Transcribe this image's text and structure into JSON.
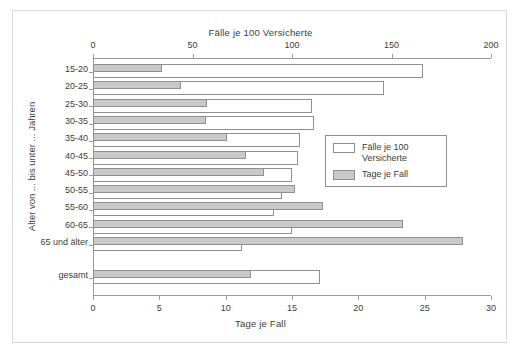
{
  "chart_data": {
    "type": "bar",
    "orientation": "horizontal",
    "title": "",
    "top_axis_title": "Fälle je 100 Versicherte",
    "bottom_axis_title": "Tage je Fall",
    "ylabel": "Alter von ... bis unter ... Jahren",
    "categories": [
      "15-20",
      "20-25",
      "25-30",
      "30-35",
      "35-40",
      "40-45",
      "45-50",
      "50-55",
      "55-60",
      "60-65",
      "65 und älter",
      "gesamt"
    ],
    "top_axis": {
      "label": "Fälle je 100 Versicherte",
      "ticks": [
        0,
        50,
        100,
        150,
        200
      ],
      "min": 0,
      "max": 200
    },
    "bottom_axis": {
      "label": "Tage je Fall",
      "ticks": [
        0,
        5,
        10,
        15,
        20,
        25,
        30
      ],
      "min": 0,
      "max": 30
    },
    "grid": false,
    "legend_position": "center-right",
    "series": [
      {
        "name": "Fälle je 100 Versicherte",
        "axis": "top",
        "color": "#ffffff",
        "edge": "#8f8f8f",
        "values": [
          166,
          146,
          110,
          111,
          104,
          103,
          100,
          95,
          91,
          100,
          75,
          114
        ]
      },
      {
        "name": "Tage je Fall",
        "axis": "bottom",
        "color": "#c9c9c9",
        "edge": "#8f8f8f",
        "values": [
          5.2,
          6.6,
          8.6,
          8.5,
          10.1,
          11.5,
          12.9,
          15.2,
          17.3,
          23.4,
          27.9,
          11.9
        ]
      }
    ],
    "legend": [
      {
        "label": "Fälle je 100 Versicherte",
        "swatch": "white"
      },
      {
        "label": "Tage je Fall",
        "swatch": "gray"
      }
    ]
  }
}
